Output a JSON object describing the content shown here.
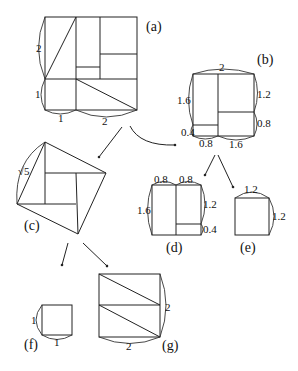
{
  "diagram": {
    "type": "dissection-puzzle",
    "panels": {
      "a": {
        "caption": "(a)",
        "labels": {
          "left_upper": "2",
          "left_lower": "1",
          "bottom_left": "1",
          "bottom_right": "2"
        }
      },
      "b": {
        "caption": "(b)",
        "labels": {
          "top": "2",
          "left_upper": "1.6",
          "left_lower": "0.4",
          "right_upper": "1.2",
          "right_lower": "0.8",
          "bottom_left": "0.8",
          "bottom_right": "1.6"
        }
      },
      "c": {
        "caption": "(c)",
        "labels": {
          "side": "√5"
        }
      },
      "d": {
        "caption": "(d)",
        "labels": {
          "top_left": "0.8",
          "top_right": "0.8",
          "left": "1.6",
          "right_upper": "1.2",
          "right_lower": "0.4"
        }
      },
      "e": {
        "caption": "(e)",
        "labels": {
          "top": "1.2",
          "right": "1.2"
        }
      },
      "f": {
        "caption": "(f)",
        "labels": {
          "left": "1",
          "bottom": "1"
        }
      },
      "g": {
        "caption": "(g)",
        "labels": {
          "right": "2",
          "bottom": "2"
        }
      }
    },
    "arrows": [
      {
        "from": "a",
        "to": "b"
      },
      {
        "from": "a",
        "to": "c"
      },
      {
        "from": "b",
        "to": "d"
      },
      {
        "from": "b",
        "to": "e"
      },
      {
        "from": "c",
        "to": "f"
      },
      {
        "from": "c",
        "to": "g"
      }
    ]
  }
}
